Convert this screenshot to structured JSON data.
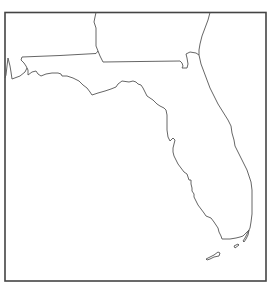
{
  "map": {
    "title": "",
    "subject": "Florida outline map",
    "regions": [
      {
        "name": "Florida",
        "role": "focus-state"
      },
      {
        "name": "Alabama",
        "role": "neighbor-state"
      },
      {
        "name": "Georgia",
        "role": "neighbor-state"
      }
    ],
    "features": [
      "state-boundaries",
      "coastline",
      "florida-keys"
    ],
    "labels": [],
    "colors": {
      "line": "#555555",
      "frame": "#444444",
      "background": "#ffffff"
    }
  }
}
